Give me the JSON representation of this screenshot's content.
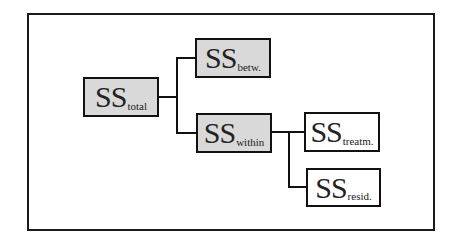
{
  "diagram": {
    "type": "hierarchy",
    "colors": {
      "shaded_fill": "#d9d9d9",
      "plain_fill": "#ffffff",
      "stroke": "#111111"
    },
    "nodes": {
      "total": {
        "main": "SS",
        "sub": "total",
        "style": "shaded"
      },
      "betw": {
        "main": "SS",
        "sub": "betw.",
        "style": "shaded"
      },
      "within": {
        "main": "SS",
        "sub": "within",
        "style": "shaded"
      },
      "treatm": {
        "main": "SS",
        "sub": "treatm.",
        "style": "plain"
      },
      "resid": {
        "main": "SS",
        "sub": "resid.",
        "style": "plain"
      }
    },
    "edges": [
      {
        "from": "total",
        "to": "betw"
      },
      {
        "from": "total",
        "to": "within"
      },
      {
        "from": "within",
        "to": "treatm"
      },
      {
        "from": "within",
        "to": "resid"
      }
    ]
  }
}
